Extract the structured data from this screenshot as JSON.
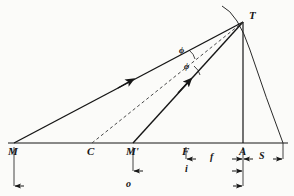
{
  "figure": {
    "type": "optics-ray-diagram",
    "background_color": "#fbfbf9",
    "ink_color": "#161616"
  },
  "axis": {
    "name": "optical-axis",
    "y": 143,
    "x_start": 8,
    "x_end": 288
  },
  "points": [
    {
      "id": "M",
      "label": "M",
      "x": 14,
      "y": 143,
      "label_x": 10,
      "label_y": 146
    },
    {
      "id": "C",
      "label": "C",
      "x": 92,
      "y": 143,
      "label_x": 88,
      "label_y": 146
    },
    {
      "id": "Mp",
      "label": "M'",
      "x": 133,
      "y": 143,
      "label_x": 127,
      "label_y": 146
    },
    {
      "id": "F",
      "label": "F",
      "x": 186,
      "y": 143,
      "label_x": 182,
      "label_y": 146
    },
    {
      "id": "A",
      "label": "A",
      "x": 243,
      "y": 143,
      "label_x": 239,
      "label_y": 146
    },
    {
      "id": "T",
      "label": "T",
      "x": 243,
      "y": 22,
      "label_x": 249,
      "label_y": 12
    }
  ],
  "rays": [
    {
      "name": "incident-ray-M-to-T",
      "style": "solid",
      "from": "M",
      "to": "T",
      "x1": 14,
      "y1": 143,
      "x2": 243,
      "y2": 22,
      "arrow_at": {
        "x": 128,
        "y": 83
      }
    },
    {
      "name": "reflected-ray-Mprime-to-T",
      "style": "solid",
      "from": "M'",
      "to": "T",
      "x1": 133,
      "y1": 143,
      "x2": 243,
      "y2": 22,
      "arrow_at": {
        "x": 188,
        "y": 83
      }
    },
    {
      "name": "normal-ray-C-to-T",
      "style": "dashed",
      "from": "C",
      "to": "T",
      "x1": 92,
      "y1": 143,
      "x2": 243,
      "y2": 22
    },
    {
      "name": "vertical-ray-T-to-A",
      "style": "solid",
      "from": "T",
      "to": "A",
      "x1": 243,
      "y1": 22,
      "x2": 243,
      "y2": 143
    }
  ],
  "mirror_arc": {
    "name": "mirror-surface-arc",
    "from": {
      "x": 222,
      "y": 6
    },
    "through": {
      "x": 243,
      "y": 22
    },
    "to": {
      "x": 283,
      "y": 143
    },
    "style": "solid"
  },
  "angles": [
    {
      "id": "phi-upper",
      "label": "ϕ",
      "x": 180,
      "y": 52
    },
    {
      "id": "phi-lower",
      "label": "ϕ",
      "x": 185,
      "y": 68
    }
  ],
  "dimensions": [
    {
      "id": "f",
      "label": "f",
      "name": "focal-length-dimension",
      "row_y": 159,
      "x_from": 186,
      "x_to": 243,
      "label_x": 212,
      "label_y": 153
    },
    {
      "id": "S",
      "label": "S",
      "name": "sagitta-dimension",
      "row_y": 159,
      "x_from": 243,
      "x_to": 283,
      "label_x": 261,
      "label_y": 152
    },
    {
      "id": "i",
      "label": "i",
      "name": "image-distance-dimension",
      "row_y": 171,
      "x_from": 133,
      "x_to": 243,
      "label_x": 186,
      "label_y": 165
    },
    {
      "id": "o",
      "label": "o",
      "name": "object-distance-dimension",
      "row_y": 186,
      "x_from": 14,
      "x_to": 243,
      "label_x": 127,
      "label_y": 180
    }
  ],
  "extension_lines": [
    {
      "name": "ext-line-M",
      "x": 14,
      "y_from": 147,
      "y_to": 186
    },
    {
      "name": "ext-line-Mp",
      "x": 133,
      "y_from": 147,
      "y_to": 171
    },
    {
      "name": "ext-line-F",
      "x": 186,
      "y_from": 147,
      "y_to": 159
    },
    {
      "name": "ext-line-A",
      "x": 243,
      "y_from": 147,
      "y_to": 186
    },
    {
      "name": "ext-line-S-right",
      "x": 283,
      "y_from": 143,
      "y_to": 159
    }
  ]
}
